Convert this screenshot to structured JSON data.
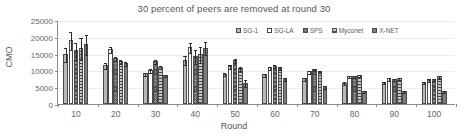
{
  "chart_data": {
    "type": "bar",
    "title": "30 percent of peers are removed at round 30",
    "xlabel": "Round",
    "ylabel": "CMO",
    "categories": [
      "10",
      "20",
      "30",
      "40",
      "50",
      "60",
      "70",
      "80",
      "90",
      "100"
    ],
    "ylim": [
      0,
      25000
    ],
    "yticks": [
      "0",
      "5000",
      "10000",
      "15000",
      "20000",
      "25000"
    ],
    "ytick_values": [
      0,
      5000,
      10000,
      15000,
      20000,
      25000
    ],
    "grid": "horizontal",
    "legend_position": "top-right",
    "series": [
      {
        "name": "SG-1",
        "pattern": "solid-light-gray",
        "values": [
          15000,
          11500,
          9100,
          13200,
          9000,
          8800,
          7600,
          6400,
          6600,
          6500
        ],
        "errors": [
          2100,
          900,
          500,
          1400,
          500,
          400,
          400,
          300,
          300,
          300
        ]
      },
      {
        "name": "SG-LA",
        "pattern": "white",
        "values": [
          19000,
          16400,
          10200,
          17000,
          11300,
          10900,
          9700,
          8200,
          7600,
          7200
        ],
        "errors": [
          2700,
          900,
          600,
          1600,
          700,
          400,
          400,
          300,
          400,
          400
        ]
      },
      {
        "name": "SPS",
        "pattern": "checkered-dark",
        "values": [
          16000,
          13700,
          12800,
          14300,
          13100,
          11400,
          10300,
          8400,
          7400,
          7500
        ],
        "errors": [
          2600,
          600,
          500,
          2100,
          600,
          400,
          300,
          300,
          300,
          300
        ]
      },
      {
        "name": "Myconet",
        "pattern": "horizontal-stripes",
        "values": [
          16700,
          12700,
          11100,
          14800,
          10700,
          10800,
          9900,
          8500,
          7700,
          8200
        ],
        "errors": [
          3100,
          600,
          400,
          2400,
          700,
          400,
          300,
          300,
          300,
          400
        ]
      },
      {
        "name": "X-NET",
        "pattern": "solid-dark-gray",
        "values": [
          17800,
          12200,
          8600,
          16800,
          6400,
          7600,
          5300,
          3900,
          3900,
          3800
        ],
        "errors": [
          2900,
          700,
          300,
          2000,
          900,
          400,
          400,
          300,
          300,
          300
        ]
      }
    ]
  }
}
